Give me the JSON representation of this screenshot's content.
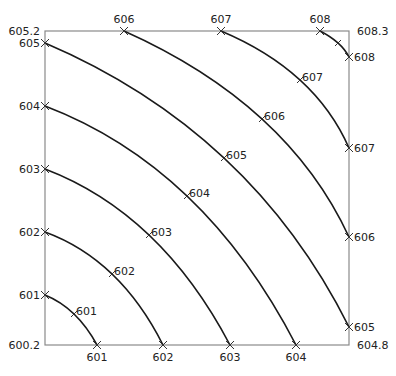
{
  "chart_data": {
    "type": "contour",
    "title": "",
    "frame": {
      "x0": 45,
      "y0": 31,
      "x1": 349,
      "y1": 345
    },
    "corner_values": {
      "top_left": "605.2",
      "top_right": "608.3",
      "bottom_left": "600.2",
      "bottom_right": "604.8"
    },
    "levels": [
      "601",
      "602",
      "603",
      "604",
      "605",
      "606",
      "607",
      "608"
    ],
    "edge_labels": {
      "bottom": [
        {
          "label": "601",
          "x": 97
        },
        {
          "label": "602",
          "x": 163
        },
        {
          "label": "603",
          "x": 230
        },
        {
          "label": "604",
          "x": 296
        }
      ],
      "left": [
        {
          "label": "601",
          "y": 295
        },
        {
          "label": "602",
          "y": 232
        },
        {
          "label": "603",
          "y": 169
        },
        {
          "label": "604",
          "y": 106
        },
        {
          "label": "605",
          "y": 43
        }
      ],
      "top": [
        {
          "label": "606",
          "x": 124
        },
        {
          "label": "607",
          "x": 221
        },
        {
          "label": "608",
          "x": 320
        }
      ],
      "right": [
        {
          "label": "605",
          "y": 327
        },
        {
          "label": "606",
          "y": 237
        },
        {
          "label": "607",
          "y": 148
        },
        {
          "label": "608",
          "y": 57
        }
      ]
    },
    "contours": [
      {
        "level": "601",
        "from": [
          45,
          295
        ],
        "to": [
          97,
          345
        ],
        "label_at": [
          74,
          314
        ]
      },
      {
        "level": "602",
        "from": [
          45,
          232
        ],
        "to": [
          163,
          345
        ],
        "label_at": [
          112,
          274
        ]
      },
      {
        "level": "603",
        "from": [
          45,
          169
        ],
        "to": [
          230,
          345
        ],
        "label_at": [
          149,
          235
        ]
      },
      {
        "level": "604",
        "from": [
          45,
          106
        ],
        "to": [
          296,
          345
        ],
        "label_at": [
          187,
          196
        ]
      },
      {
        "level": "605",
        "from": [
          45,
          43
        ],
        "to": [
          349,
          327
        ],
        "label_at": [
          224,
          158
        ]
      },
      {
        "level": "606",
        "from": [
          124,
          31
        ],
        "to": [
          349,
          237
        ],
        "label_at": [
          262,
          119
        ]
      },
      {
        "level": "607",
        "from": [
          221,
          31
        ],
        "to": [
          349,
          148
        ],
        "label_at": [
          300,
          80
        ]
      },
      {
        "level": "608",
        "from": [
          320,
          31
        ],
        "to": [
          349,
          57
        ],
        "label_at": [
          338,
          43
        ]
      }
    ],
    "line_color": "#1a1a1a",
    "frame_color": "#888888"
  }
}
